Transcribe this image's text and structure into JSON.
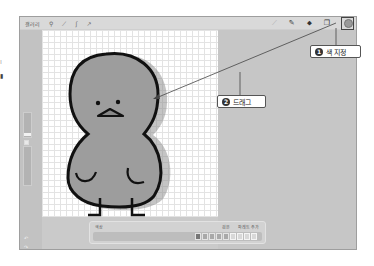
{
  "toolbar": {
    "left": {
      "gallery_label": "갤러리",
      "icons": [
        "wrench-icon",
        "magic-wand-icon",
        "selection-icon",
        "transform-arrow-icon"
      ]
    },
    "right": {
      "icons": [
        "brush-icon",
        "smudge-icon",
        "eraser-icon",
        "layers-icon"
      ],
      "color_swatch": "#9a9a9a"
    }
  },
  "sidebar": {
    "sliders": [
      {
        "name": "brush-size-slider"
      },
      {
        "name": "opacity-slider"
      }
    ],
    "modify_button_glyph": "□",
    "undo_glyph": "↶",
    "redo_glyph": "↷"
  },
  "canvas": {
    "fill_color": "#9d9d9d",
    "outline_color": "#111111",
    "grid_color": "#e3e3e3"
  },
  "palette_panel": {
    "title": "색상",
    "right_labels": [
      "검은",
      "파레트 추가"
    ],
    "swatch_count": 9
  },
  "annotations": [
    {
      "number": "1",
      "label": "색 지정"
    },
    {
      "number": "2",
      "label": "드래그"
    }
  ],
  "left_margin_glyphs": [
    "⁞",
    "▮"
  ]
}
